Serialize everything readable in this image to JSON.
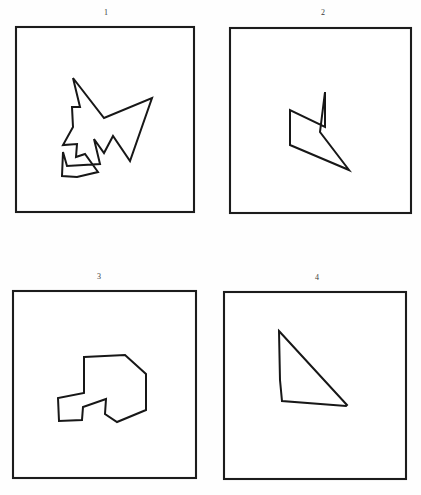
{
  "page": {
    "background_color": "#ffffff",
    "ink_color": "#171717",
    "width": 421,
    "height": 495
  },
  "panels": [
    {
      "label": "1",
      "label_x": 96,
      "label_y": 8,
      "frame": {
        "x": 16,
        "y": 27,
        "w": 178,
        "h": 185
      },
      "shape_name": "zigzag-double-arrow-polygon",
      "vertex_count": 16,
      "points": "73,78 104,118 152,98 130,161 113,136 104,153 94,139 100,164 67,166 63,152 62,176 77,177 98,172 85,154 76,157 77,144 63,145 73,127 72,107 80,107"
    },
    {
      "label": "2",
      "label_x": 313,
      "label_y": 8,
      "frame": {
        "x": 230,
        "y": 28,
        "w": 181,
        "h": 185
      },
      "shape_name": "double-barb-arrow-polygon",
      "vertex_count": 6,
      "points": "325,92 320,132 349,170 290,145 290,110 325,127"
    },
    {
      "label": "3",
      "label_x": 89,
      "label_y": 272,
      "frame": {
        "x": 13,
        "y": 291,
        "w": 183,
        "h": 187
      },
      "shape_name": "staircase-zigzag-polygon",
      "vertex_count": 10,
      "points": "84,357 125,355 146,374 146,410 117,422 105,414 106,399 83,407 82,420 59,421 58,398 84,393"
    },
    {
      "label": "4",
      "label_x": 307,
      "label_y": 273,
      "frame": {
        "x": 224,
        "y": 292,
        "w": 182,
        "h": 187
      },
      "shape_name": "concave-triangle-wedge-polygon",
      "vertex_count": 5,
      "points": "279,331 347,405 346,406 282,401 280,380"
    }
  ]
}
